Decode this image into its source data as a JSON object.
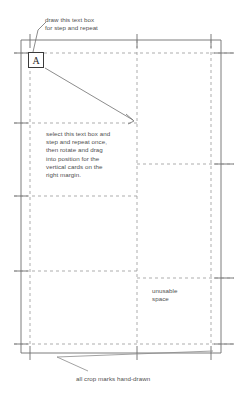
{
  "document": {
    "title": "step and repeat layout diagram",
    "background_color": "#ffffff",
    "line_color": "#8a8a8a",
    "border_color": "#6e6e6e",
    "text_color": "#4f4f4f"
  },
  "annotations": {
    "top_note": "draw this text box\nfor step and repeat",
    "middle_note": "select this text box and\nstep and repeat once,\nthen rotate and drag\ninto position for the\nvertical cards on the\nright margin.",
    "unusable_note": "unusable\nspace",
    "bottom_note": "all crop marks hand-drawn"
  },
  "text_box": {
    "letter": "A"
  },
  "layout": {
    "page_border": {
      "x1": 21,
      "y1": 40,
      "x2": 221,
      "y2": 353
    },
    "vertical_guides": [
      30,
      137,
      211
    ],
    "horizontal_guides": [
      53,
      123,
      196,
      271,
      344
    ],
    "right_horizontal_guides": [
      164,
      278
    ],
    "arrow": {
      "from_x": 45,
      "from_y": 68,
      "to_x": 133,
      "to_y": 120
    }
  }
}
